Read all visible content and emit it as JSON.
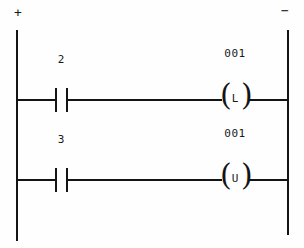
{
  "diagram": {
    "type": "ladder-logic",
    "colors": {
      "line": "#141414",
      "text": "#1a1a1a",
      "background": "#fefefe"
    },
    "power_rails": {
      "left": {
        "polarity_label": "+",
        "name": "positive-rail"
      },
      "right": {
        "polarity_label": "−",
        "name": "negative-rail"
      }
    },
    "rungs": [
      {
        "index": 1,
        "contact": {
          "label": "2",
          "kind": "normally-open",
          "icon": "no-contact-icon"
        },
        "coil": {
          "address": "001",
          "letter": "L",
          "kind": "latch",
          "icon": "latch-coil-icon"
        }
      },
      {
        "index": 2,
        "contact": {
          "label": "3",
          "kind": "normally-open",
          "icon": "no-contact-icon"
        },
        "coil": {
          "address": "001",
          "letter": "U",
          "kind": "unlatch",
          "icon": "unlatch-coil-icon"
        }
      }
    ]
  }
}
